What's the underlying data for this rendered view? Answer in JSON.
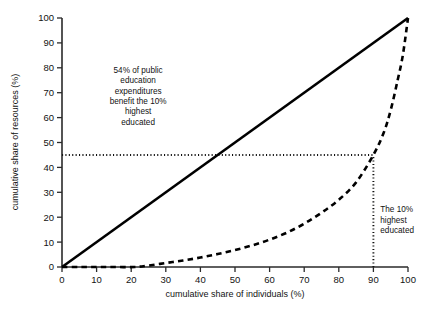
{
  "chart_data": {
    "type": "line",
    "title": "",
    "xlabel": "cumulative share of individuals (%)",
    "ylabel": "cumulative share of resources (%)",
    "xlim": [
      0,
      100
    ],
    "ylim": [
      0,
      100
    ],
    "xticks": [
      0,
      10,
      20,
      30,
      40,
      50,
      60,
      70,
      80,
      90,
      100
    ],
    "yticks": [
      0,
      10,
      20,
      30,
      40,
      50,
      60,
      70,
      80,
      90,
      100
    ],
    "xtick_labels": [
      "0",
      "10",
      "20",
      "30",
      "40",
      "50",
      "60",
      "70",
      "80",
      "90",
      "100"
    ],
    "ytick_labels": [
      "0",
      "10",
      "20",
      "30",
      "40",
      "50",
      "60",
      "70",
      "80",
      "90",
      "100"
    ],
    "grid": false,
    "legend": false,
    "series": [
      {
        "name": "line of perfect equality",
        "style": "solid",
        "color": "#000000",
        "x": [
          0,
          100
        ],
        "values": [
          0,
          100
        ]
      },
      {
        "name": "Lorenz curve of public education expenditures",
        "style": "dashed",
        "color": "#000000",
        "x": [
          0,
          5,
          10,
          15,
          21,
          25,
          30,
          35,
          40,
          45,
          50,
          55,
          60,
          65,
          70,
          75,
          80,
          85,
          90,
          93,
          95,
          97,
          98.5,
          100
        ],
        "values": [
          0,
          0,
          0,
          0,
          0,
          0.6,
          1.6,
          2.6,
          3.8,
          5.2,
          6.8,
          8.7,
          11.0,
          13.8,
          17.4,
          21.8,
          27.0,
          34.0,
          45.0,
          54.0,
          63.0,
          75.0,
          85.0,
          100
        ]
      }
    ],
    "reference_lines": [
      {
        "name": "resource-share-reference",
        "orientation": "horizontal",
        "value": 45,
        "from": 0,
        "to": 90,
        "style": "dotted"
      },
      {
        "name": "top-decile-reference",
        "orientation": "vertical",
        "value": 90,
        "from": 0,
        "to": 45,
        "style": "dotted"
      }
    ],
    "annotations": [
      {
        "name": "expenditure-share-annotation",
        "lines": [
          "54% of public",
          "education",
          "expenditures",
          "benefit the 10%",
          "highest",
          "educated"
        ],
        "x": 22,
        "y": 78,
        "align": "center"
      },
      {
        "name": "top-decile-annotation",
        "lines": [
          "The 10% highest",
          "educated"
        ],
        "display_lines": [
          "The 10%",
          "highest",
          "educated"
        ],
        "x": 92,
        "y": 22,
        "align": "left"
      }
    ]
  },
  "colors": {
    "background": "#ffffff",
    "axis": "#2b2b2b",
    "ink": "#000000",
    "text": "#121212"
  }
}
